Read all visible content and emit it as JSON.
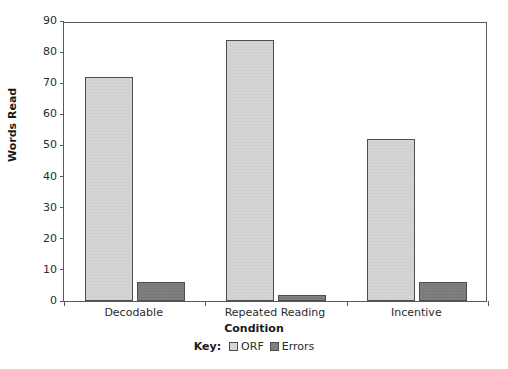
{
  "chart_data": {
    "type": "bar",
    "title": "",
    "xlabel": "Condition",
    "ylabel": "Words Read",
    "categories": [
      "Decodable",
      "Repeated Reading",
      "Incentive"
    ],
    "series": [
      {
        "name": "ORF",
        "values": [
          72,
          84,
          52
        ],
        "color": "#d5d5d5"
      },
      {
        "name": "Errors",
        "values": [
          6,
          2,
          6
        ],
        "color": "#808080"
      }
    ],
    "ylim": [
      0,
      90
    ],
    "ytick_step": 10,
    "yticks": [
      0,
      10,
      20,
      30,
      40,
      50,
      60,
      70,
      80,
      90
    ],
    "ytick_labels": [
      "0",
      "10",
      "20",
      "30",
      "40",
      "50",
      "60",
      "70",
      "80",
      "90"
    ],
    "grid": false,
    "legend_position": "bottom-center",
    "legend_prefix": "Key:"
  },
  "axis": {
    "y_title": "Words Read",
    "x_title": "Condition"
  },
  "legend": {
    "key_label": "Key:",
    "entries": [
      {
        "label": "ORF"
      },
      {
        "label": "Errors"
      }
    ]
  },
  "colors": {
    "orf_fill": "#d5d5d5",
    "errors_fill": "#808080",
    "bar_border": "#4d4d4d",
    "axis": "#5a5a5a",
    "text": "#2b2b2b",
    "background": "#ffffff"
  }
}
